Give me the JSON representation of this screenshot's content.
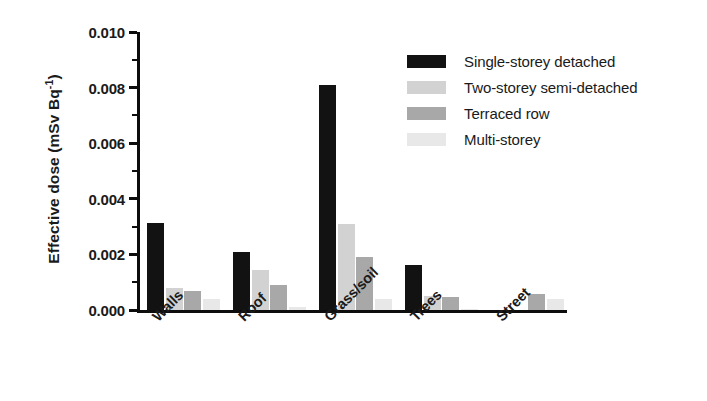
{
  "chart_data": {
    "type": "bar",
    "title": "",
    "subtitle": "",
    "xlabel": "",
    "ylabel": "Effective dose (mSv Bq-1)",
    "ylabel_parts": {
      "base": "Effective dose (mSv Bq",
      "superscript": "-1",
      "tail": ")"
    },
    "categories": [
      "Walls",
      "Roof",
      "Grass/soil",
      "Trees",
      "Street"
    ],
    "series": [
      {
        "name": "Single-storey detached",
        "color": "#121212",
        "values": [
          0.00312,
          0.00208,
          0.0081,
          0.00162,
          0.0
        ]
      },
      {
        "name": "Two-storey semi-detached",
        "color": "#d2d2d2",
        "values": [
          0.0008,
          0.00145,
          0.00308,
          0.0005,
          0.0
        ]
      },
      {
        "name": "Terraced row",
        "color": "#a8a8a8",
        "values": [
          0.00068,
          0.0009,
          0.00192,
          0.00048,
          0.00058
        ]
      },
      {
        "name": "Multi-storey",
        "color": "#e8e8e8",
        "values": [
          0.00038,
          0.0001,
          0.0004,
          4e-05,
          0.0004
        ]
      }
    ],
    "ylim": [
      0.0,
      0.01
    ],
    "ytick_values": [
      0.0,
      0.002,
      0.004,
      0.006,
      0.008,
      0.01
    ],
    "ytick_labels": [
      "0.000",
      "0.002",
      "0.004",
      "0.006",
      "0.008",
      "0.010"
    ],
    "yminor_values": [
      0.001,
      0.003,
      0.005,
      0.007,
      0.009
    ],
    "grid": false,
    "legend_position": "top-right",
    "axis_color": "#0d0d0d"
  },
  "legend": {
    "entries": [
      {
        "label": "Single-storey detached",
        "color": "#121212"
      },
      {
        "label": "Two-storey semi-detached",
        "color": "#d2d2d2"
      },
      {
        "label": "Terraced row",
        "color": "#a8a8a8"
      },
      {
        "label": "Multi-storey",
        "color": "#e8e8e8"
      }
    ]
  }
}
